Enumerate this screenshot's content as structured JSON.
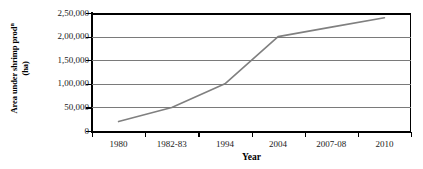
{
  "chart_data": {
    "type": "line",
    "title": "",
    "xlabel": "Year",
    "ylabel_line1": "Area under shrimp prod",
    "ylabel_sup": "n",
    "ylabel_line2": "(ha)",
    "categories": [
      "1980",
      "1982-83",
      "1994",
      "2004",
      "2007-08",
      "2010"
    ],
    "series": [
      {
        "name": "Area under shrimp production (ha)",
        "values": [
          20000,
          50000,
          100000,
          200000,
          220000,
          240000
        ],
        "color": "#808080"
      }
    ],
    "ylim": [
      0,
      250000
    ],
    "ytick_labels": [
      "2,50,000",
      "2,00,000",
      "1,50,000",
      "1,00,000",
      "50,000",
      "0"
    ],
    "ytick_values": [
      250000,
      200000,
      150000,
      100000,
      50000,
      0
    ],
    "grid": "horizontal",
    "legend": "none",
    "axis_color": "#000000",
    "grid_color": "#7a7a7a"
  }
}
